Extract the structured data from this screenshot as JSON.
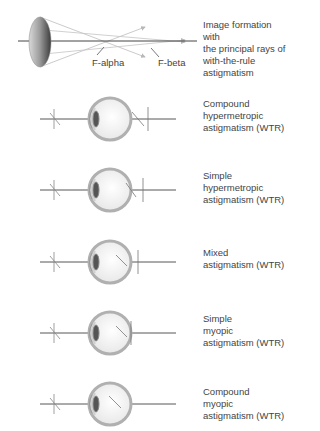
{
  "diagram": {
    "top": {
      "caption": "Image formation with\nthe principal rays of\nwith-the-rule\nastigmatism",
      "f_alpha": "F-alpha",
      "f_beta": "F-beta"
    },
    "rows": [
      {
        "caption": "Compound\nhypermetropic\nastigmatism (WTR)"
      },
      {
        "caption": "Simple\nhypermetropic\nastigmatism (WTR)"
      },
      {
        "caption": "Mixed\nastigmatism (WTR)"
      },
      {
        "caption": "Simple\nmyopic\nastigmatism (WTR)"
      },
      {
        "caption": "Compound\nmyopic\nastigmatism (WTR)"
      }
    ],
    "colors": {
      "line": "#555555",
      "ray": "#b8b8b8",
      "eye_ring": "#a8a8a8",
      "text": "#444444"
    }
  }
}
